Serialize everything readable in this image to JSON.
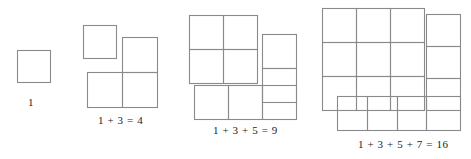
{
  "diagram": {
    "line_color": "#8a8a8a",
    "background_color": "#ffffff",
    "text_color": "#1d1d1d",
    "cell_size": 33,
    "figures": [
      {
        "id": "figure-1",
        "caption": "1",
        "odd_terms": [
          1
        ],
        "sum": 1,
        "square_side": 1,
        "total_cells": 1,
        "parts": {
          "core_block": {
            "cols": 0,
            "rows": 0
          },
          "new_gnomon_cells": 1
        },
        "cells": [
          {
            "x": 17,
            "y": 50,
            "w": 33,
            "h": 32,
            "group": "gnomon"
          }
        ]
      },
      {
        "id": "figure-2",
        "caption": "1 + 3 = 4",
        "odd_terms": [
          1,
          3
        ],
        "sum": 4,
        "square_side": 2,
        "total_cells": 4,
        "parts": {
          "core_block": {
            "cols": 1,
            "rows": 1
          },
          "new_gnomon_cells": 3
        },
        "cells": [
          {
            "x": 83,
            "y": 25,
            "w": 33,
            "h": 33,
            "group": "core"
          },
          {
            "x": 122,
            "y": 37,
            "w": 35,
            "h": 35,
            "group": "gnomon"
          },
          {
            "x": 87,
            "y": 72,
            "w": 35,
            "h": 35,
            "group": "gnomon"
          },
          {
            "x": 122,
            "y": 72,
            "w": 35,
            "h": 35,
            "group": "gnomon"
          }
        ]
      },
      {
        "id": "figure-3",
        "caption": "1 + 3 + 5 = 9",
        "odd_terms": [
          1,
          3,
          5
        ],
        "sum": 9,
        "square_side": 3,
        "total_cells": 9,
        "parts": {
          "core_block": {
            "cols": 2,
            "rows": 2
          },
          "new_gnomon_cells": 5
        },
        "cells": [
          {
            "x": 189,
            "y": 15,
            "w": 34,
            "h": 34,
            "group": "core"
          },
          {
            "x": 223,
            "y": 15,
            "w": 34,
            "h": 34,
            "group": "core"
          },
          {
            "x": 189,
            "y": 49,
            "w": 34,
            "h": 34,
            "group": "core"
          },
          {
            "x": 223,
            "y": 49,
            "w": 34,
            "h": 34,
            "group": "core"
          },
          {
            "x": 262,
            "y": 34,
            "w": 34,
            "h": 34,
            "group": "gnomon"
          },
          {
            "x": 262,
            "y": 68,
            "w": 34,
            "h": 34,
            "group": "gnomon"
          },
          {
            "x": 194,
            "y": 85,
            "w": 34,
            "h": 34,
            "group": "gnomon"
          },
          {
            "x": 228,
            "y": 85,
            "w": 34,
            "h": 34,
            "group": "gnomon"
          },
          {
            "x": 262,
            "y": 85,
            "w": 34,
            "h": 34,
            "group": "gnomon"
          }
        ]
      },
      {
        "id": "figure-4",
        "caption": "1 + 3 + 5 + 7 = 16",
        "odd_terms": [
          1,
          3,
          5,
          7
        ],
        "sum": 16,
        "square_side": 4,
        "total_cells": 16,
        "parts": {
          "core_block": {
            "cols": 3,
            "rows": 3
          },
          "new_gnomon_cells": 7
        },
        "cells": [
          {
            "x": 322,
            "y": 8,
            "w": 34,
            "h": 34,
            "group": "core"
          },
          {
            "x": 356,
            "y": 8,
            "w": 34,
            "h": 34,
            "group": "core"
          },
          {
            "x": 390,
            "y": 8,
            "w": 34,
            "h": 34,
            "group": "core"
          },
          {
            "x": 322,
            "y": 42,
            "w": 34,
            "h": 34,
            "group": "core"
          },
          {
            "x": 356,
            "y": 42,
            "w": 34,
            "h": 34,
            "group": "core"
          },
          {
            "x": 390,
            "y": 42,
            "w": 34,
            "h": 34,
            "group": "core"
          },
          {
            "x": 322,
            "y": 76,
            "w": 34,
            "h": 34,
            "group": "core"
          },
          {
            "x": 356,
            "y": 76,
            "w": 34,
            "h": 34,
            "group": "core"
          },
          {
            "x": 390,
            "y": 76,
            "w": 34,
            "h": 34,
            "group": "core"
          },
          {
            "x": 426,
            "y": 14,
            "w": 34,
            "h": 32,
            "group": "gnomon"
          },
          {
            "x": 426,
            "y": 46,
            "w": 34,
            "h": 32,
            "group": "gnomon"
          },
          {
            "x": 426,
            "y": 78,
            "w": 34,
            "h": 32,
            "group": "gnomon"
          },
          {
            "x": 337,
            "y": 96,
            "w": 30,
            "h": 34,
            "group": "gnomon"
          },
          {
            "x": 367,
            "y": 96,
            "w": 30,
            "h": 34,
            "group": "gnomon"
          },
          {
            "x": 397,
            "y": 96,
            "w": 29,
            "h": 34,
            "group": "gnomon"
          },
          {
            "x": 426,
            "y": 96,
            "w": 34,
            "h": 34,
            "group": "gnomon"
          }
        ]
      }
    ]
  }
}
